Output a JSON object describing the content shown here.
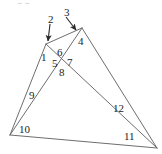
{
  "figure": {
    "kind": "geometry-diagram",
    "stroke_color": "#6e6e6e",
    "label_color": "#1b1b1b",
    "background_color": "#ffffff",
    "width": 162,
    "height": 154
  },
  "points": {
    "apex_left": {
      "name": "A",
      "x": 46,
      "y": 44
    },
    "apex_right": {
      "name": "B",
      "x": 82,
      "y": 28
    },
    "base_left": {
      "name": "C",
      "x": 10,
      "y": 135
    },
    "base_right": {
      "name": "D",
      "x": 157,
      "y": 148
    },
    "crossing": {
      "name": "X",
      "x": 64,
      "y": 59
    }
  },
  "segments": [
    {
      "id": "apexleft-baseleft",
      "from": "apex_left",
      "to": "base_left"
    },
    {
      "id": "apexleft-baseright",
      "from": "apex_left",
      "to": "base_right"
    },
    {
      "id": "apexright-baseleft",
      "from": "apex_right",
      "to": "base_left"
    },
    {
      "id": "apexright-baseright",
      "from": "apex_right",
      "to": "base_right"
    },
    {
      "id": "base",
      "from": "base_left",
      "to": "base_right"
    },
    {
      "id": "apexleft-apexright",
      "from": "apex_left",
      "to": "apex_right"
    }
  ],
  "angle_labels": [
    {
      "id": 1,
      "text": "1",
      "x": 41,
      "y": 52,
      "at": "apex_left, left side"
    },
    {
      "id": 4,
      "text": "4",
      "x": 78,
      "y": 36,
      "at": "apex_right, right side"
    },
    {
      "id": 5,
      "text": "5",
      "x": 52,
      "y": 58,
      "at": "crossing, left"
    },
    {
      "id": 6,
      "text": "6",
      "x": 57,
      "y": 47,
      "at": "crossing, top"
    },
    {
      "id": 7,
      "text": "7",
      "x": 67,
      "y": 57,
      "at": "crossing, right"
    },
    {
      "id": 8,
      "text": "8",
      "x": 59,
      "y": 67,
      "at": "crossing, bottom"
    },
    {
      "id": 9,
      "text": "9",
      "x": 29,
      "y": 90,
      "at": "base_left, upper ray"
    },
    {
      "id": 10,
      "text": "10",
      "x": 19,
      "y": 124,
      "at": "base_left, interior"
    },
    {
      "id": 11,
      "text": "11",
      "x": 124,
      "y": 131,
      "at": "base_right, interior"
    },
    {
      "id": 12,
      "text": "12",
      "x": 113,
      "y": 103,
      "at": "base_right, upper ray"
    }
  ],
  "callouts": [
    {
      "id": 2,
      "text": "2",
      "label_x": 48,
      "label_y": 14,
      "arrow": {
        "x1": 50,
        "y1": 24,
        "x2": 48,
        "y2": 42
      },
      "target": "apex_left"
    },
    {
      "id": 3,
      "text": "3",
      "label_x": 64,
      "label_y": 7,
      "arrow": {
        "x1": 66,
        "y1": 17,
        "x2": 75,
        "y2": 30
      },
      "target": "apex_right"
    }
  ],
  "artifacts": {
    "top_smudge_text": "g g"
  }
}
